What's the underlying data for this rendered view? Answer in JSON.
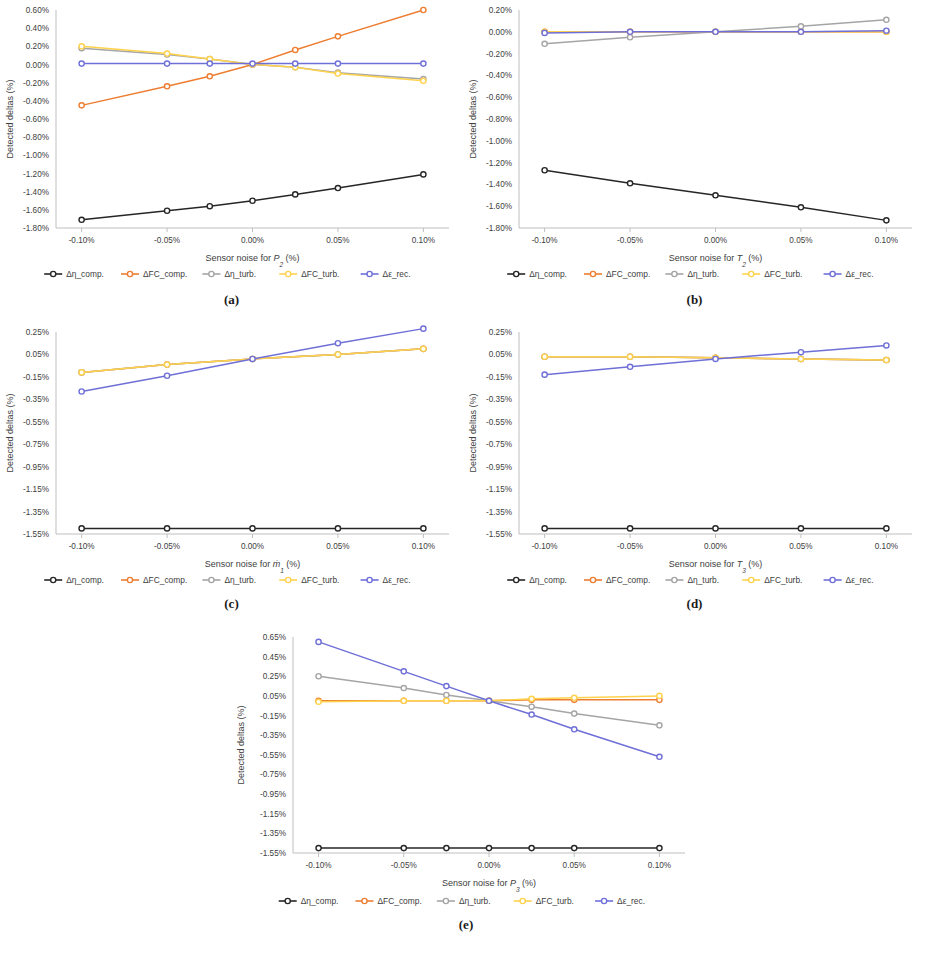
{
  "figure": {
    "panels": [
      {
        "caption": "(a)",
        "chart_data": {
          "type": "line",
          "title": "",
          "xlabel": "Sensor noise for P2 (%)",
          "xlabel_prefix": "Sensor noise for ",
          "xlabel_symbol": "P",
          "xlabel_subscript": "2",
          "xlabel_suffix": " (%)",
          "ylabel": "Detected deltas (%)",
          "grid": false,
          "legend_position": "bottom",
          "x": [
            -0.1,
            -0.05,
            -0.025,
            0.0,
            0.025,
            0.05,
            0.1
          ],
          "xtick_labels": [
            "-0.10%",
            "-0.05%",
            "0.00%",
            "0.05%",
            "0.10%"
          ],
          "xtick_values": [
            -0.1,
            -0.05,
            0.0,
            0.05,
            0.1
          ],
          "xlim": [
            -0.115,
            0.115
          ],
          "ytick_labels": [
            "0.60%",
            "0.40%",
            "0.20%",
            "0.00%",
            "-0.20%",
            "-0.40%",
            "-0.60%",
            "-0.80%",
            "-1.00%",
            "-1.20%",
            "-1.40%",
            "-1.60%",
            "-1.80%"
          ],
          "ytick_values": [
            0.6,
            0.4,
            0.2,
            0.0,
            -0.2,
            -0.4,
            -0.6,
            -0.8,
            -1.0,
            -1.2,
            -1.4,
            -1.6,
            -1.8
          ],
          "ylim": [
            -1.8,
            0.6
          ],
          "series": [
            {
              "name": "Δη_comp.",
              "color": "#262626",
              "values": [
                -1.71,
                -1.61,
                -1.56,
                -1.5,
                -1.43,
                -1.36,
                -1.21
              ]
            },
            {
              "name": "ΔFC_comp.",
              "color": "#ED7D31",
              "values": [
                -0.45,
                -0.24,
                -0.13,
                0.0,
                0.16,
                0.31,
                0.6
              ]
            },
            {
              "name": "Δη_turb.",
              "color": "#A5A5A5",
              "values": [
                0.18,
                0.11,
                0.06,
                0.0,
                -0.03,
                -0.09,
                -0.16
              ]
            },
            {
              "name": "ΔFC_turb.",
              "color": "#FFD24D",
              "values": [
                0.2,
                0.12,
                0.06,
                0.0,
                -0.03,
                -0.1,
                -0.18
              ]
            },
            {
              "name": "Δε_rec.",
              "color": "#6F6FD8",
              "values": [
                0.01,
                0.01,
                0.01,
                0.01,
                0.01,
                0.01,
                0.01
              ]
            }
          ]
        }
      },
      {
        "caption": "(b)",
        "chart_data": {
          "type": "line",
          "title": "",
          "xlabel": "Sensor noise for T2 (%)",
          "xlabel_prefix": "Sensor noise for ",
          "xlabel_symbol": "T",
          "xlabel_subscript": "2",
          "xlabel_suffix": " (%)",
          "ylabel": "Detected deltas (%)",
          "grid": false,
          "legend_position": "bottom",
          "x": [
            -0.1,
            -0.05,
            0.0,
            0.05,
            0.1
          ],
          "xtick_labels": [
            "-0.10%",
            "-0.05%",
            "0.00%",
            "0.05%",
            "0.10%"
          ],
          "xtick_values": [
            -0.1,
            -0.05,
            0.0,
            0.05,
            0.1
          ],
          "xlim": [
            -0.115,
            0.115
          ],
          "ytick_labels": [
            "0.20%",
            "0.00%",
            "-0.20%",
            "-0.40%",
            "-0.60%",
            "-0.80%",
            "-1.00%",
            "-1.20%",
            "-1.40%",
            "-1.60%",
            "-1.80%"
          ],
          "ytick_values": [
            0.2,
            0.0,
            -0.2,
            -0.4,
            -0.6,
            -0.8,
            -1.0,
            -1.2,
            -1.4,
            -1.6,
            -1.8
          ],
          "ylim": [
            -1.8,
            0.2
          ],
          "series": [
            {
              "name": "Δη_comp.",
              "color": "#262626",
              "values": [
                -1.27,
                -1.39,
                -1.5,
                -1.61,
                -1.73
              ]
            },
            {
              "name": "ΔFC_comp.",
              "color": "#ED7D31",
              "values": [
                0.0,
                0.0,
                0.0,
                0.0,
                0.0
              ]
            },
            {
              "name": "Δη_turb.",
              "color": "#A5A5A5",
              "values": [
                -0.11,
                -0.05,
                0.0,
                0.05,
                0.11
              ]
            },
            {
              "name": "ΔFC_turb.",
              "color": "#FFD24D",
              "values": [
                0.0,
                0.0,
                0.0,
                0.0,
                0.0
              ]
            },
            {
              "name": "Δε_rec.",
              "color": "#6F6FD8",
              "values": [
                -0.01,
                0.0,
                0.0,
                0.0,
                0.01
              ]
            }
          ]
        }
      },
      {
        "caption": "(c)",
        "chart_data": {
          "type": "line",
          "title": "",
          "xlabel": "Sensor noise for ṁ₁ (%)",
          "xlabel_prefix": "Sensor noise for ",
          "xlabel_symbol": "ṁ",
          "xlabel_subscript": "1",
          "xlabel_suffix": " (%)",
          "ylabel": "Detected deltas (%)",
          "grid": false,
          "legend_position": "bottom",
          "x": [
            -0.1,
            -0.05,
            0.0,
            0.05,
            0.1
          ],
          "xtick_labels": [
            "-0.10%",
            "-0.05%",
            "0.00%",
            "0.05%",
            "0.10%"
          ],
          "xtick_values": [
            -0.1,
            -0.05,
            0.0,
            0.05,
            0.1
          ],
          "xlim": [
            -0.115,
            0.115
          ],
          "ytick_labels": [
            "0.25%",
            "0.05%",
            "-0.15%",
            "-0.35%",
            "-0.55%",
            "-0.75%",
            "-0.95%",
            "-1.15%",
            "-1.35%",
            "-1.55%"
          ],
          "ytick_values": [
            0.25,
            0.05,
            -0.15,
            -0.35,
            -0.55,
            -0.75,
            -0.95,
            -1.15,
            -1.35,
            -1.55
          ],
          "ylim": [
            -1.55,
            0.25
          ],
          "series": [
            {
              "name": "Δη_comp.",
              "color": "#262626",
              "values": [
                -1.5,
                -1.5,
                -1.5,
                -1.5,
                -1.5
              ]
            },
            {
              "name": "ΔFC_comp.",
              "color": "#ED7D31",
              "values": [
                -0.11,
                -0.04,
                0.01,
                0.05,
                0.1
              ]
            },
            {
              "name": "Δη_turb.",
              "color": "#A5A5A5",
              "values": [
                -0.11,
                -0.04,
                0.01,
                0.05,
                0.1
              ]
            },
            {
              "name": "ΔFC_turb.",
              "color": "#FFD24D",
              "values": [
                -0.11,
                -0.04,
                0.01,
                0.05,
                0.1
              ]
            },
            {
              "name": "Δε_rec.",
              "color": "#6F6FD8",
              "values": [
                -0.28,
                -0.14,
                0.01,
                0.15,
                0.28
              ]
            }
          ]
        }
      },
      {
        "caption": "(d)",
        "chart_data": {
          "type": "line",
          "title": "",
          "xlabel": "Sensor noise for T3 (%)",
          "xlabel_prefix": "Sensor noise for ",
          "xlabel_symbol": "T",
          "xlabel_subscript": "3",
          "xlabel_suffix": " (%)",
          "ylabel": "Detected deltas (%)",
          "grid": false,
          "legend_position": "bottom",
          "x": [
            -0.1,
            -0.05,
            0.0,
            0.05,
            0.1
          ],
          "xtick_labels": [
            "-0.10%",
            "-0.05%",
            "0.00%",
            "0.05%",
            "0.10%"
          ],
          "xtick_values": [
            -0.1,
            -0.05,
            0.0,
            0.05,
            0.1
          ],
          "xlim": [
            -0.115,
            0.115
          ],
          "ytick_labels": [
            "0.25%",
            "0.05%",
            "-0.15%",
            "-0.35%",
            "-0.55%",
            "-0.75%",
            "-0.95%",
            "-1.15%",
            "-1.35%",
            "-1.55%"
          ],
          "ytick_values": [
            0.25,
            0.05,
            -0.15,
            -0.35,
            -0.55,
            -0.75,
            -0.95,
            -1.15,
            -1.35,
            -1.55
          ],
          "ylim": [
            -1.55,
            0.25
          ],
          "series": [
            {
              "name": "Δη_comp.",
              "color": "#262626",
              "values": [
                -1.5,
                -1.5,
                -1.5,
                -1.5,
                -1.5
              ]
            },
            {
              "name": "ΔFC_comp.",
              "color": "#ED7D31",
              "values": [
                0.03,
                0.03,
                0.02,
                0.01,
                0.0
              ]
            },
            {
              "name": "Δη_turb.",
              "color": "#A5A5A5",
              "values": [
                0.03,
                0.03,
                0.02,
                0.01,
                0.0
              ]
            },
            {
              "name": "ΔFC_turb.",
              "color": "#FFD24D",
              "values": [
                0.03,
                0.03,
                0.02,
                0.01,
                0.0
              ]
            },
            {
              "name": "Δε_rec.",
              "color": "#6F6FD8",
              "values": [
                -0.13,
                -0.06,
                0.01,
                0.07,
                0.13
              ]
            }
          ]
        }
      },
      {
        "caption": "(e)",
        "chart_data": {
          "type": "line",
          "title": "",
          "xlabel": "Sensor noise for P3 (%)",
          "xlabel_prefix": "Sensor noise for ",
          "xlabel_symbol": "P",
          "xlabel_subscript": "3",
          "xlabel_suffix": " (%)",
          "ylabel": "Detected deltas (%)",
          "grid": false,
          "legend_position": "bottom",
          "x": [
            -0.1,
            -0.05,
            -0.025,
            0.0,
            0.025,
            0.05,
            0.1
          ],
          "xtick_labels": [
            "-0.10%",
            "-0.05%",
            "0.00%",
            "0.05%",
            "0.10%"
          ],
          "xtick_values": [
            -0.1,
            -0.05,
            0.0,
            0.05,
            0.1
          ],
          "xlim": [
            -0.115,
            0.115
          ],
          "ytick_labels": [
            "0.65%",
            "0.45%",
            "0.25%",
            "0.05%",
            "-0.15%",
            "-0.35%",
            "-0.55%",
            "-0.75%",
            "-0.95%",
            "-1.15%",
            "-1.35%",
            "-1.55%"
          ],
          "ytick_values": [
            0.65,
            0.45,
            0.25,
            0.05,
            -0.15,
            -0.35,
            -0.55,
            -0.75,
            -0.95,
            -1.15,
            -1.35,
            -1.55
          ],
          "ylim": [
            -1.55,
            0.65
          ],
          "series": [
            {
              "name": "Δη_comp.",
              "color": "#262626",
              "values": [
                -1.5,
                -1.5,
                -1.5,
                -1.5,
                -1.5,
                -1.5,
                -1.5
              ]
            },
            {
              "name": "ΔFC_comp.",
              "color": "#ED7D31",
              "values": [
                0.0,
                0.0,
                0.0,
                0.0,
                0.01,
                0.01,
                0.01
              ]
            },
            {
              "name": "Δη_turb.",
              "color": "#A5A5A5",
              "values": [
                0.25,
                0.13,
                0.06,
                0.0,
                -0.06,
                -0.13,
                -0.25
              ]
            },
            {
              "name": "ΔFC_turb.",
              "color": "#FFD24D",
              "values": [
                -0.01,
                0.0,
                0.0,
                0.0,
                0.02,
                0.03,
                0.05
              ]
            },
            {
              "name": "Δε_rec.",
              "color": "#6F6FD8",
              "values": [
                0.6,
                0.3,
                0.15,
                0.0,
                -0.14,
                -0.29,
                -0.57
              ]
            }
          ]
        }
      }
    ],
    "legend": [
      {
        "label": "Δη_comp.",
        "color": "#262626"
      },
      {
        "label": "ΔFC_comp.",
        "color": "#ED7D31"
      },
      {
        "label": "Δη_turb.",
        "color": "#A5A5A5"
      },
      {
        "label": "ΔFC_turb.",
        "color": "#FFD24D"
      },
      {
        "label": "Δε_rec.",
        "color": "#6F6FD8"
      }
    ]
  }
}
